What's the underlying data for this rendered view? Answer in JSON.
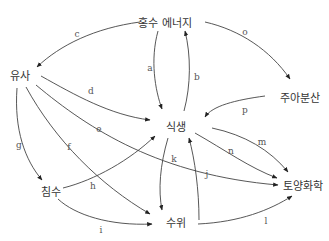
{
  "diagram": {
    "type": "directed-graph",
    "nodes": [
      {
        "id": "flood_energy",
        "label": "홍수 에너지",
        "x": 165,
        "y": 22
      },
      {
        "id": "sediment",
        "label": "유사",
        "x": 20,
        "y": 75
      },
      {
        "id": "propagule",
        "label": "주아분산",
        "x": 300,
        "y": 97
      },
      {
        "id": "vegetation",
        "label": "식생",
        "x": 165,
        "y": 126
      },
      {
        "id": "inundation",
        "label": "침수",
        "x": 50,
        "y": 190
      },
      {
        "id": "soil_chem",
        "label": "토양화학",
        "x": 301,
        "y": 184
      },
      {
        "id": "water_level",
        "label": "수위",
        "x": 163,
        "y": 219
      }
    ],
    "edges": [
      {
        "label": "a",
        "from": "flood_energy",
        "to": "vegetation"
      },
      {
        "label": "b",
        "from": "vegetation",
        "to": "flood_energy"
      },
      {
        "label": "c",
        "from": "flood_energy",
        "to": "sediment"
      },
      {
        "label": "d",
        "from": "sediment",
        "to": "vegetation"
      },
      {
        "label": "e",
        "from": "sediment",
        "to": "soil_chem"
      },
      {
        "label": "f",
        "from": "sediment",
        "to": "water_level"
      },
      {
        "label": "g",
        "from": "sediment",
        "to": "inundation"
      },
      {
        "label": "h",
        "from": "inundation",
        "to": "vegetation"
      },
      {
        "label": "i",
        "from": "inundation",
        "to": "water_level"
      },
      {
        "label": "j",
        "from": "water_level",
        "to": "vegetation"
      },
      {
        "label": "k",
        "from": "vegetation",
        "to": "water_level"
      },
      {
        "label": "l",
        "from": "water_level",
        "to": "soil_chem"
      },
      {
        "label": "m",
        "from": "vegetation",
        "to": "soil_chem"
      },
      {
        "label": "n",
        "from": "vegetation",
        "to": "soil_chem"
      },
      {
        "label": "o",
        "from": "flood_energy",
        "to": "propagule"
      },
      {
        "label": "p",
        "from": "propagule",
        "to": "vegetation"
      }
    ]
  },
  "nodes": {
    "flood_energy": "홍수 에너지",
    "sediment": "유사",
    "propagule": "주아분산",
    "vegetation": "식생",
    "inundation": "침수",
    "soil_chem": "토양화학",
    "water_level": "수위"
  },
  "edge_labels": {
    "a": "a",
    "b": "b",
    "c": "c",
    "d": "d",
    "e": "e",
    "f": "f",
    "g": "g",
    "h": "h",
    "i": "i",
    "j": "j",
    "k": "k",
    "l": "l",
    "m": "m",
    "n": "n",
    "o": "o",
    "p": "p"
  },
  "colors": {
    "stroke": "#444444",
    "node_text": "#333333",
    "edge_text": "#555555",
    "background": "#ffffff"
  }
}
